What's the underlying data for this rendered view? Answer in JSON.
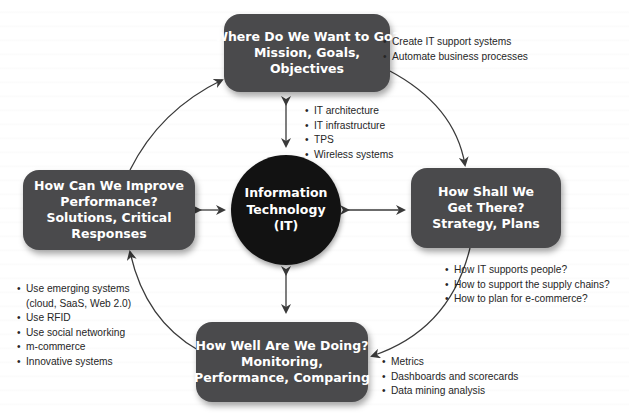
{
  "diagram": {
    "center": {
      "lines": [
        "Information",
        "Technology",
        "(IT)"
      ],
      "bullets": [
        "IT architecture",
        "IT infrastructure",
        "TPS",
        "Wireless systems"
      ]
    },
    "nodes": {
      "top": {
        "lines": [
          "Where Do We Want to Go?",
          "Mission, Goals,",
          "Objectives"
        ],
        "bullets": [
          "Create IT support systems",
          "Automate business processes"
        ]
      },
      "right": {
        "lines": [
          "How Shall We",
          "Get There?",
          "Strategy, Plans"
        ],
        "bullets": [
          "How IT supports people?",
          "How to support the supply chains?",
          "How to plan for e-commerce?"
        ]
      },
      "bottom": {
        "lines": [
          "How Well Are We Doing?",
          "Monitoring,",
          "Performance, Comparing"
        ],
        "bullets": [
          "Metrics",
          "Dashboards and scorecards",
          "Data mining analysis"
        ]
      },
      "left": {
        "lines": [
          "How Can We Improve",
          "Performance?",
          "Solutions, Critical",
          "Responses"
        ],
        "bullets": [
          {
            "line1": "Use emerging systems",
            "line2": "(cloud, SaaS, Web 2.0)"
          },
          "Use RFID",
          "Use social networking",
          "m-commerce",
          "Innovative systems"
        ]
      }
    },
    "colors": {
      "box_fill": "#4a4a4c",
      "circle_fill": "#121212",
      "arrow": "#3a3a3a",
      "text_light": "#ffffff",
      "text_dark": "#262626"
    }
  }
}
